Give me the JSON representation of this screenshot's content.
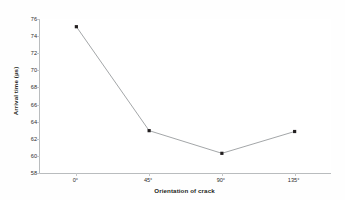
{
  "chart_data": {
    "type": "line",
    "title": "",
    "xlabel": "Orientation of crack",
    "ylabel": "Arrival time (µs)",
    "categories": [
      "0°",
      "45°",
      "90°",
      "135°"
    ],
    "values": [
      75.1,
      62.95,
      60.3,
      62.85
    ],
    "series": [
      {
        "name": "Arrival time",
        "values": [
          75.1,
          62.95,
          60.3,
          62.85
        ]
      }
    ],
    "ylim": [
      58,
      76
    ],
    "ytick_labels": [
      "76",
      "74",
      "72",
      "70",
      "68",
      "66",
      "64",
      "62",
      "60",
      "58"
    ],
    "ytick_values": [
      76,
      74,
      72,
      70,
      68,
      66,
      64,
      62,
      60,
      58
    ],
    "ytick_step": 2,
    "xtick_labels": [
      "0°",
      "45°",
      "90°",
      "135°"
    ],
    "grid": false,
    "legend": false,
    "legend_position": "none",
    "marker": "square",
    "line_color": "#8c8f92",
    "marker_color": "#231f20",
    "axis_color": "#b9bcbe",
    "background_color": "#ffffff",
    "annotations": []
  }
}
